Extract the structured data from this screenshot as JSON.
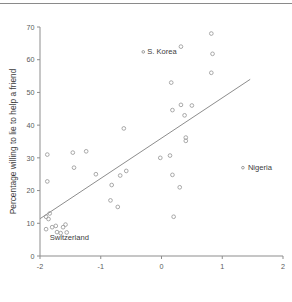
{
  "figure": {
    "has_top_rule": true,
    "background": "#ffffff",
    "marker_color": "#9a9a9a",
    "axis_color": "#8d8d8d",
    "text_color": "#3c3c3c"
  },
  "chart_data": {
    "type": "scatter",
    "title": "",
    "xlabel": "",
    "ylabel": "Percentage willing to lie to help a friend",
    "xlim": [
      -2,
      2
    ],
    "ylim": [
      0,
      70
    ],
    "xticks": [
      -2,
      -1,
      0,
      1,
      2
    ],
    "xticklabels": [
      "-2",
      "-1",
      "0",
      "1",
      "2"
    ],
    "yticks": [
      0,
      10,
      20,
      30,
      40,
      50,
      60,
      70
    ],
    "yticklabels": [
      "0",
      "10",
      "20",
      "30",
      "40",
      "50",
      "60",
      "70"
    ],
    "grid": false,
    "legend": null,
    "points": [
      {
        "x": -1.88,
        "y": 31.0
      },
      {
        "x": -1.88,
        "y": 22.8
      },
      {
        "x": -1.9,
        "y": 12.0
      },
      {
        "x": -1.86,
        "y": 11.3
      },
      {
        "x": -1.9,
        "y": 8.2
      },
      {
        "x": -1.84,
        "y": 13.0
      },
      {
        "x": -1.8,
        "y": 8.8
      },
      {
        "x": -1.74,
        "y": 9.2
      },
      {
        "x": -1.72,
        "y": 7.3
      },
      {
        "x": -1.66,
        "y": 7.0
      },
      {
        "x": -1.62,
        "y": 8.8
      },
      {
        "x": -1.58,
        "y": 9.6
      },
      {
        "x": -1.56,
        "y": 7.2
      },
      {
        "x": -1.46,
        "y": 31.6
      },
      {
        "x": -1.44,
        "y": 27.0
      },
      {
        "x": -1.24,
        "y": 32.0
      },
      {
        "x": -1.08,
        "y": 25.0
      },
      {
        "x": -0.82,
        "y": 21.7
      },
      {
        "x": -0.84,
        "y": 17.0
      },
      {
        "x": -0.72,
        "y": 15.0
      },
      {
        "x": -0.68,
        "y": 24.6
      },
      {
        "x": -0.62,
        "y": 39.0
      },
      {
        "x": -0.58,
        "y": 26.0
      },
      {
        "x": -0.02,
        "y": 30.0
      },
      {
        "x": 0.14,
        "y": 30.7
      },
      {
        "x": 0.16,
        "y": 53.0
      },
      {
        "x": 0.18,
        "y": 44.6
      },
      {
        "x": 0.18,
        "y": 24.8
      },
      {
        "x": 0.2,
        "y": 12.0
      },
      {
        "x": 0.3,
        "y": 21.0
      },
      {
        "x": 0.32,
        "y": 64.0
      },
      {
        "x": 0.32,
        "y": 46.2
      },
      {
        "x": 0.38,
        "y": 43.0
      },
      {
        "x": 0.4,
        "y": 36.2
      },
      {
        "x": 0.4,
        "y": 35.2
      },
      {
        "x": 0.5,
        "y": 46.0
      },
      {
        "x": 0.82,
        "y": 68.0
      },
      {
        "x": 0.84,
        "y": 61.8
      },
      {
        "x": 0.82,
        "y": 56.0
      }
    ],
    "annotated_points": [
      {
        "label": "S. Korea",
        "x": -0.3,
        "y": 62.4,
        "label_dx": 4,
        "label_dy": 2.4
      },
      {
        "label": "Nigeria",
        "x": 1.34,
        "y": 27.0,
        "label_dx": 5,
        "label_dy": 2.4
      },
      {
        "label": "Switzerland",
        "x": -1.84,
        "y": 5.0,
        "label_dx": 0,
        "label_dy": 0
      }
    ],
    "fit_line": {
      "type": "linear-regression",
      "x_start": -2.0,
      "y_start": 11.4,
      "x_end": 1.46,
      "y_end": 54.0
    }
  }
}
